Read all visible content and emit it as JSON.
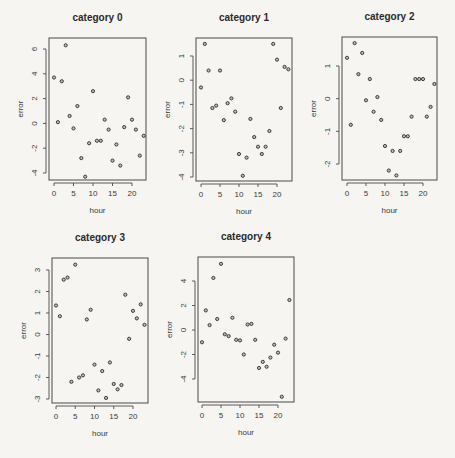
{
  "chart_data": [
    {
      "type": "scatter",
      "title": "category 0",
      "xlabel": "hour",
      "ylabel": "error",
      "xlim": [
        0,
        23
      ],
      "ylim": [
        -4.3,
        6.3
      ],
      "grid": false,
      "x_ticks": [
        0,
        5,
        10,
        15,
        20
      ],
      "y_ticks": [
        -4,
        -2,
        0,
        2,
        4,
        6
      ],
      "x": [
        0,
        1,
        2,
        3,
        4,
        5,
        6,
        7,
        8,
        9,
        10,
        11,
        12,
        13,
        14,
        15,
        16,
        17,
        18,
        19,
        20,
        21,
        22,
        23
      ],
      "y": [
        3.7,
        0.1,
        3.4,
        6.3,
        0.6,
        -0.4,
        1.4,
        -2.8,
        -4.3,
        -1.6,
        2.6,
        -1.4,
        -1.4,
        0.3,
        -0.5,
        -3.0,
        -1.7,
        -3.4,
        -0.3,
        2.1,
        0.3,
        -0.5,
        -2.6,
        -1.0
      ],
      "layout": {
        "frame": [
          49,
          38,
          146,
          180
        ],
        "x_map": [
          0,
          54,
          20,
          132
        ],
        "y_map": [
          6,
          49,
          -4,
          173
        ]
      }
    },
    {
      "type": "scatter",
      "title": "category 1",
      "xlabel": "hour",
      "ylabel": "error",
      "xlim": [
        0,
        23
      ],
      "ylim": [
        -3.95,
        1.5
      ],
      "grid": false,
      "x_ticks": [
        0,
        5,
        10,
        15,
        20
      ],
      "y_ticks": [
        -4,
        -3,
        -2,
        -1,
        0,
        1
      ],
      "x": [
        0,
        1,
        2,
        3,
        4,
        5,
        6,
        7,
        8,
        9,
        10,
        11,
        12,
        13,
        14,
        15,
        16,
        17,
        18,
        19,
        20,
        21,
        22,
        23
      ],
      "y": [
        -0.3,
        1.5,
        0.4,
        -1.15,
        -1.05,
        0.4,
        -1.65,
        -0.95,
        -0.75,
        -1.3,
        -3.05,
        -3.95,
        -3.2,
        -1.6,
        -2.35,
        -2.75,
        -3.05,
        -2.75,
        -2.1,
        1.5,
        0.85,
        -1.15,
        0.55,
        0.45
      ],
      "layout": {
        "frame": [
          196,
          38,
          292,
          181
        ],
        "x_map": [
          0,
          201,
          20,
          277
        ],
        "y_map": [
          1,
          56,
          -4,
          177
        ]
      }
    },
    {
      "type": "scatter",
      "title": "category 2",
      "xlabel": "hour",
      "ylabel": "error",
      "xlim": [
        0,
        23
      ],
      "ylim": [
        -2.35,
        1.7
      ],
      "grid": false,
      "x_ticks": [
        0,
        5,
        10,
        15,
        20
      ],
      "y_ticks": [
        -2,
        -1,
        0,
        1
      ],
      "x": [
        0,
        1,
        2,
        3,
        4,
        5,
        6,
        7,
        8,
        9,
        10,
        11,
        12,
        13,
        14,
        15,
        16,
        17,
        18,
        19,
        20,
        21,
        22,
        23
      ],
      "y": [
        1.25,
        -0.8,
        1.7,
        0.75,
        1.4,
        -0.05,
        0.6,
        -0.4,
        0.05,
        -0.65,
        -1.45,
        -2.2,
        -1.6,
        -2.35,
        -1.6,
        -1.15,
        -1.15,
        -0.55,
        0.6,
        0.6,
        0.6,
        -0.55,
        -0.25,
        0.45
      ],
      "layout": {
        "frame": [
          342,
          37,
          437,
          180
        ],
        "x_map": [
          0,
          347,
          20,
          423
        ],
        "y_map": [
          1,
          66,
          -2,
          164
        ]
      }
    },
    {
      "type": "scatter",
      "title": "category 3",
      "xlabel": "hour",
      "ylabel": "error",
      "xlim": [
        0,
        23
      ],
      "ylim": [
        -2.95,
        3.25
      ],
      "grid": false,
      "x_ticks": [
        0,
        5,
        10,
        15,
        20
      ],
      "y_ticks": [
        -3,
        -2,
        -1,
        0,
        1,
        2,
        3
      ],
      "x": [
        0,
        1,
        2,
        3,
        4,
        5,
        6,
        7,
        8,
        9,
        10,
        11,
        12,
        13,
        14,
        15,
        16,
        17,
        18,
        19,
        20,
        21,
        22,
        23
      ],
      "y": [
        1.35,
        0.85,
        2.55,
        2.65,
        -2.2,
        3.25,
        -2.0,
        -1.9,
        0.7,
        1.15,
        -1.4,
        -2.6,
        -1.7,
        -2.95,
        -1.3,
        -2.3,
        -2.55,
        -2.35,
        1.85,
        -0.2,
        1.1,
        0.75,
        1.4,
        0.45
      ],
      "layout": {
        "frame": [
          52,
          258,
          148,
          403
        ],
        "x_map": [
          0,
          56,
          20,
          133
        ],
        "y_map": [
          3,
          270,
          -3,
          399
        ]
      }
    },
    {
      "type": "scatter",
      "title": "category 4",
      "xlabel": "hour",
      "ylabel": "error",
      "xlim": [
        0,
        23
      ],
      "ylim": [
        -5.45,
        5.4
      ],
      "grid": false,
      "x_ticks": [
        0,
        5,
        10,
        15,
        20
      ],
      "y_ticks": [
        -4,
        -2,
        0,
        2,
        4
      ],
      "x": [
        0,
        1,
        2,
        3,
        4,
        5,
        6,
        7,
        8,
        9,
        10,
        11,
        12,
        13,
        14,
        15,
        16,
        17,
        18,
        19,
        20,
        21,
        22,
        23
      ],
      "y": [
        -1.0,
        1.6,
        0.4,
        4.25,
        0.9,
        5.4,
        -0.35,
        -0.5,
        1.0,
        -0.8,
        -0.85,
        -2.0,
        0.45,
        0.5,
        -0.8,
        -3.1,
        -2.6,
        -3.0,
        -2.25,
        -1.2,
        -1.85,
        -5.45,
        -0.7,
        2.45
      ],
      "layout": {
        "frame": [
          198,
          257,
          294,
          402
        ],
        "x_map": [
          0,
          202,
          20,
          278
        ],
        "y_map": [
          4,
          281,
          -4,
          379
        ]
      }
    }
  ]
}
